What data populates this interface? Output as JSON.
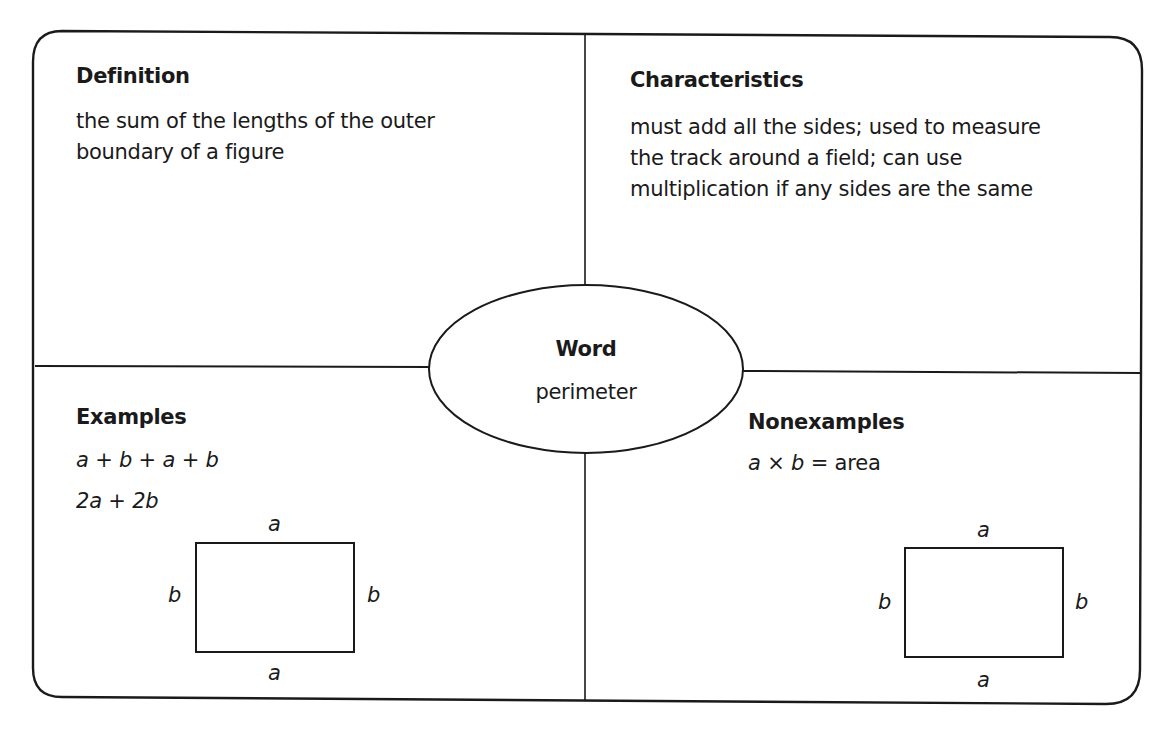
{
  "organizer": {
    "type": "Frayer model graphic organizer",
    "center": {
      "heading": "Word",
      "term": "perimeter"
    },
    "definition": {
      "heading": "Definition",
      "lines": [
        "the sum of the lengths of the outer",
        "boundary of a figure"
      ]
    },
    "characteristics": {
      "heading": "Characteristics",
      "lines": [
        "must add all the sides; used to measure",
        "the track around a field; can use",
        "multiplication if any sides are the same"
      ]
    },
    "examples": {
      "heading": "Examples",
      "expressions": [
        "a + b + a + b",
        "2a + 2b"
      ],
      "figure": {
        "shape": "rectangle",
        "top_label": "a",
        "bottom_label": "a",
        "left_label": "b",
        "right_label": "b"
      }
    },
    "nonexamples": {
      "heading": "Nonexamples",
      "expression": "a × b = area",
      "expression_parts": {
        "a": "a",
        "times": "×",
        "b": "b",
        "equals": "=",
        "result": "area"
      },
      "figure": {
        "shape": "rectangle",
        "top_label": "a",
        "bottom_label": "a",
        "left_label": "b",
        "right_label": "b"
      }
    },
    "colors": {
      "line": "#1a1a1a",
      "background": "#ffffff"
    }
  }
}
